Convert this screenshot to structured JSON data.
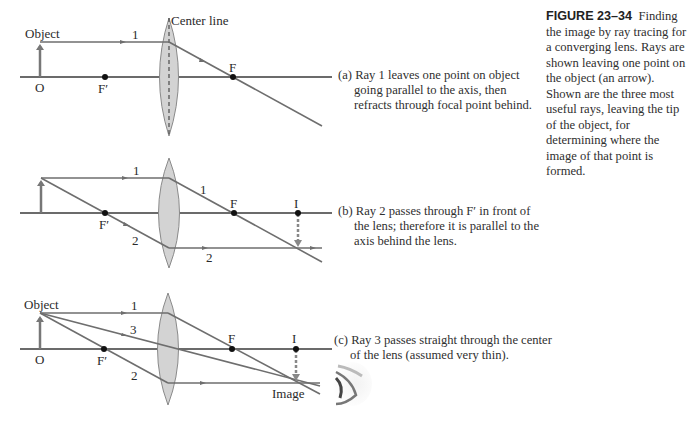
{
  "figure": {
    "number": "FIGURE 23–34",
    "caption": "Finding the image by ray tracing for a converging lens. Rays are shown leaving one point on the object (an arrow). Shown are the three most useful rays, leaving the tip of the object, for determining where the image of that point is formed."
  },
  "panels": [
    {
      "id": "a",
      "caption": "(a) Ray 1 leaves one point on object going parallel to the axis, then refracts through focal point behind.",
      "labels": {
        "object": "Object",
        "center_line": "Center line",
        "origin": "O",
        "front_focal": "F′",
        "focal": "F",
        "ray1": "1"
      }
    },
    {
      "id": "b",
      "caption": "(b) Ray 2 passes through F′ in front of the lens; therefore it is parallel to the axis behind the lens.",
      "labels": {
        "front_focal": "F′",
        "focal": "F",
        "image_point": "I",
        "ray1_before": "1",
        "ray1_after": "1",
        "ray2_before": "2",
        "ray2_after": "2"
      }
    },
    {
      "id": "c",
      "caption": "(c) Ray 3 passes straight through the center of the lens (assumed very thin).",
      "labels": {
        "object": "Object",
        "origin": "O",
        "front_focal": "F′",
        "focal": "F",
        "image_point": "I",
        "image": "Image",
        "ray1": "1",
        "ray2": "2",
        "ray3": "3"
      }
    }
  ],
  "icons": {
    "eye": "eye-icon"
  }
}
